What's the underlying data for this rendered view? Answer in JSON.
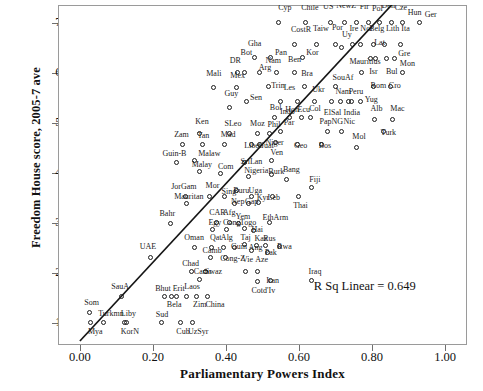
{
  "chart_data": {
    "type": "scatter",
    "title": "",
    "xlabel": "Parliamentary Powers Index",
    "ylabel": "Freedom House score, 2005-7 ave",
    "xlim": [
      -0.06,
      1.06
    ],
    "ylim": [
      0.55,
      7.35
    ],
    "xticks": [
      "0.00",
      "0.20",
      "0.40",
      "0.60",
      "0.80",
      "1.00"
    ],
    "xtickvals": [
      0.0,
      0.2,
      0.4,
      0.6,
      0.8,
      1.0
    ],
    "yticks": [
      "1.00",
      "2.00",
      "3.00",
      "4.00",
      "5.00",
      "6.00",
      "7.00"
    ],
    "ytickvals": [
      1,
      2,
      3,
      4,
      5,
      6,
      7
    ],
    "grid": false,
    "legend": "none",
    "annotation": "R Sq Linear = 0.649",
    "annotation_x": 0.78,
    "annotation_y": 1.72,
    "fit_line": {
      "x0": 0.0,
      "y0": 0.63,
      "x1": 0.855,
      "y1": 7.36
    },
    "points": [
      {
        "label": "Cyp",
        "x": 0.545,
        "y": 7.0,
        "lx": 0.543,
        "ly": 7.3
      },
      {
        "label": "Chile",
        "x": 0.62,
        "y": 7.0,
        "lx": 0.606,
        "ly": 7.3
      },
      {
        "label": "US",
        "x": 0.688,
        "y": 7.0,
        "lx": 0.666,
        "ly": 7.32
      },
      {
        "label": "NewZ",
        "x": 0.726,
        "y": 7.0,
        "lx": 0.702,
        "ly": 7.34
      },
      {
        "label": "Fir",
        "x": 0.76,
        "y": 7.0,
        "lx": 0.766,
        "ly": 7.32
      },
      {
        "label": "Pol",
        "x": 0.792,
        "y": 7.0,
        "lx": 0.8,
        "ly": 7.28
      },
      {
        "label": "Den",
        "x": 0.822,
        "y": 7.0,
        "lx": 0.826,
        "ly": 7.33
      },
      {
        "label": "Cze",
        "x": 0.854,
        "y": 7.0,
        "lx": 0.862,
        "ly": 7.3
      },
      {
        "label": "Hun",
        "x": 0.884,
        "y": 7.0,
        "lx": 0.898,
        "ly": 7.2
      },
      {
        "label": "Ger",
        "x": 0.93,
        "y": 7.0,
        "lx": 0.944,
        "ly": 7.16
      },
      {
        "label": "CostR",
        "x": 0.588,
        "y": 6.55,
        "lx": 0.578,
        "ly": 6.85
      },
      {
        "label": "Taiw",
        "x": 0.65,
        "y": 6.55,
        "lx": 0.638,
        "ly": 6.88
      },
      {
        "label": "Por",
        "x": 0.7,
        "y": 6.55,
        "lx": 0.69,
        "ly": 6.9
      },
      {
        "label": "Uy",
        "x": 0.718,
        "y": 6.5,
        "lx": 0.718,
        "ly": 6.76
      },
      {
        "label": "Ire",
        "x": 0.748,
        "y": 6.55,
        "lx": 0.738,
        "ly": 6.88
      },
      {
        "label": "Nor",
        "x": 0.77,
        "y": 6.55,
        "lx": 0.768,
        "ly": 6.88
      },
      {
        "label": "Belg",
        "x": 0.806,
        "y": 6.55,
        "lx": 0.792,
        "ly": 6.88
      },
      {
        "label": "Lith",
        "x": 0.836,
        "y": 6.55,
        "lx": 0.838,
        "ly": 6.88
      },
      {
        "label": "Ita",
        "x": 0.878,
        "y": 6.55,
        "lx": 0.88,
        "ly": 6.88
      },
      {
        "label": "Gha",
        "x": 0.48,
        "y": 6.3,
        "lx": 0.46,
        "ly": 6.58
      },
      {
        "label": "Pan",
        "x": 0.524,
        "y": 6.3,
        "lx": 0.534,
        "ly": 6.4
      },
      {
        "label": "Kor5",
        "x": 0.61,
        "y": 6.3,
        "lx": 0.62,
        "ly": 6.4
      },
      {
        "label": "Lat",
        "x": 0.812,
        "y": 6.28,
        "lx": 0.806,
        "ly": 6.6
      },
      {
        "label": "Gre",
        "x": 0.862,
        "y": 6.28,
        "lx": 0.872,
        "ly": 6.38
      },
      {
        "label": "Bul",
        "x": 0.842,
        "y": 6.28,
        "lx": 0.838,
        "ly": 6.02
      },
      {
        "label": "Isr",
        "x": 0.796,
        "y": 6.28,
        "lx": 0.792,
        "ly": 6.02
      },
      {
        "label": "DR",
        "x": 0.432,
        "y": 6.0,
        "lx": 0.41,
        "ly": 6.24
      },
      {
        "label": "Bot",
        "x": 0.452,
        "y": 6.0,
        "lx": 0.44,
        "ly": 6.4
      },
      {
        "label": "Arg",
        "x": 0.492,
        "y": 6.0,
        "lx": 0.49,
        "ly": 6.1
      },
      {
        "label": "Nam",
        "x": 0.54,
        "y": 6.0,
        "lx": 0.508,
        "ly": 6.24
      },
      {
        "label": "Ben",
        "x": 0.588,
        "y": 6.0,
        "lx": 0.57,
        "ly": 6.26
      },
      {
        "label": "Mauritius",
        "x": 0.772,
        "y": 6.0,
        "lx": 0.738,
        "ly": 6.22
      },
      {
        "label": "Mon",
        "x": 0.884,
        "y": 6.0,
        "lx": 0.876,
        "ly": 6.18
      },
      {
        "label": "Mali",
        "x": 0.366,
        "y": 5.7,
        "lx": 0.346,
        "ly": 5.98
      },
      {
        "label": "Mex",
        "x": 0.43,
        "y": 5.7,
        "lx": 0.412,
        "ly": 5.94
      },
      {
        "label": "Bra",
        "x": 0.616,
        "y": 5.72,
        "lx": 0.606,
        "ly": 5.98
      },
      {
        "label": "Trin",
        "x": 0.518,
        "y": 5.72,
        "lx": 0.524,
        "ly": 5.74
      },
      {
        "label": "SouAf",
        "x": 0.7,
        "y": 5.72,
        "lx": 0.692,
        "ly": 5.9
      },
      {
        "label": "Rom",
        "x": 0.806,
        "y": 5.72,
        "lx": 0.796,
        "ly": 5.74
      },
      {
        "label": "Cro",
        "x": 0.852,
        "y": 5.72,
        "lx": 0.846,
        "ly": 5.74
      },
      {
        "label": "Guy",
        "x": 0.412,
        "y": 5.3,
        "lx": 0.396,
        "ly": 5.58
      },
      {
        "label": "Sen",
        "x": 0.458,
        "y": 5.42,
        "lx": 0.466,
        "ly": 5.5
      },
      {
        "label": "Les",
        "x": 0.552,
        "y": 5.42,
        "lx": 0.558,
        "ly": 5.7
      },
      {
        "label": "Indo",
        "x": 0.596,
        "y": 5.42,
        "lx": 0.548,
        "ly": 5.22
      },
      {
        "label": "Ukr",
        "x": 0.644,
        "y": 5.42,
        "lx": 0.636,
        "ly": 5.66
      },
      {
        "label": "ElSal",
        "x": 0.69,
        "y": 5.42,
        "lx": 0.668,
        "ly": 5.2
      },
      {
        "label": "Nam2",
        "x": 0.714,
        "y": 5.42,
        "lx": 0.7,
        "ly": 5.62
      },
      {
        "label": "Peru",
        "x": 0.738,
        "y": 5.42,
        "lx": 0.736,
        "ly": 5.62
      },
      {
        "label": "Yug",
        "x": 0.77,
        "y": 5.42,
        "lx": 0.78,
        "ly": 5.46
      },
      {
        "label": "India",
        "x": 0.744,
        "y": 5.42,
        "lx": 0.722,
        "ly": 5.2
      },
      {
        "label": "Bol",
        "x": 0.534,
        "y": 5.1,
        "lx": 0.52,
        "ly": 5.3
      },
      {
        "label": "Hon",
        "x": 0.576,
        "y": 5.1,
        "lx": 0.562,
        "ly": 5.26
      },
      {
        "label": "Ecu",
        "x": 0.608,
        "y": 5.1,
        "lx": 0.596,
        "ly": 5.26
      },
      {
        "label": "Col",
        "x": 0.634,
        "y": 5.1,
        "lx": 0.628,
        "ly": 5.28
      },
      {
        "label": "Alb",
        "x": 0.808,
        "y": 5.05,
        "lx": 0.796,
        "ly": 5.28
      },
      {
        "label": "Mac",
        "x": 0.856,
        "y": 5.05,
        "lx": 0.85,
        "ly": 5.28
      },
      {
        "label": "Ken",
        "x": 0.33,
        "y": 4.78,
        "lx": 0.316,
        "ly": 5.02
      },
      {
        "label": "SLeo",
        "x": 0.41,
        "y": 4.78,
        "lx": 0.396,
        "ly": 4.98
      },
      {
        "label": "Moz",
        "x": 0.488,
        "y": 4.78,
        "lx": 0.466,
        "ly": 4.98
      },
      {
        "label": "Phil",
        "x": 0.52,
        "y": 4.78,
        "lx": 0.514,
        "ly": 4.96
      },
      {
        "label": "Par",
        "x": 0.552,
        "y": 4.82,
        "lx": 0.558,
        "ly": 5.0
      },
      {
        "label": "PapNG",
        "x": 0.678,
        "y": 4.82,
        "lx": 0.656,
        "ly": 5.02
      },
      {
        "label": "Nic",
        "x": 0.718,
        "y": 4.82,
        "lx": 0.722,
        "ly": 5.02
      },
      {
        "label": "Turk",
        "x": 0.834,
        "y": 4.82,
        "lx": 0.824,
        "ly": 4.8
      },
      {
        "label": "Zam",
        "x": 0.282,
        "y": 4.56,
        "lx": 0.258,
        "ly": 4.76
      },
      {
        "label": "Tan",
        "x": 0.336,
        "y": 4.56,
        "lx": 0.322,
        "ly": 4.74
      },
      {
        "label": "Mad",
        "x": 0.398,
        "y": 4.56,
        "lx": 0.386,
        "ly": 4.76
      },
      {
        "label": "Liber",
        "x": 0.47,
        "y": 4.56,
        "lx": 0.45,
        "ly": 4.54
      },
      {
        "label": "Guat",
        "x": 0.494,
        "y": 4.56,
        "lx": 0.488,
        "ly": 4.54
      },
      {
        "label": "Niger",
        "x": 0.538,
        "y": 4.6,
        "lx": 0.508,
        "ly": 4.6
      },
      {
        "label": "Geo",
        "x": 0.596,
        "y": 4.56,
        "lx": 0.586,
        "ly": 4.54
      },
      {
        "label": "Bos",
        "x": 0.662,
        "y": 4.56,
        "lx": 0.654,
        "ly": 4.54
      },
      {
        "label": "Mol",
        "x": 0.758,
        "y": 4.5,
        "lx": 0.746,
        "ly": 4.72
      },
      {
        "label": "Guin-B",
        "x": 0.266,
        "y": 4.2,
        "lx": 0.226,
        "ly": 4.38
      },
      {
        "label": "Malaw",
        "x": 0.316,
        "y": 4.24,
        "lx": 0.324,
        "ly": 4.38
      },
      {
        "label": "Malay",
        "x": 0.33,
        "y": 4.02,
        "lx": 0.306,
        "ly": 4.16
      },
      {
        "label": "SriLan",
        "x": 0.452,
        "y": 4.2,
        "lx": 0.44,
        "ly": 4.22
      },
      {
        "label": "Ven",
        "x": 0.526,
        "y": 4.24,
        "lx": 0.522,
        "ly": 4.4
      },
      {
        "label": "Com",
        "x": 0.386,
        "y": 3.98,
        "lx": 0.378,
        "ly": 4.12
      },
      {
        "label": "Nigeria",
        "x": 0.462,
        "y": 3.92,
        "lx": 0.45,
        "ly": 4.04
      },
      {
        "label": "Burk",
        "x": 0.526,
        "y": 3.96,
        "lx": 0.516,
        "ly": 4.02
      },
      {
        "label": "Bang",
        "x": 0.566,
        "y": 3.86,
        "lx": 0.556,
        "ly": 4.06
      },
      {
        "label": "Fiji",
        "x": 0.636,
        "y": 3.7,
        "lx": 0.628,
        "ly": 3.86
      },
      {
        "label": "JorGam",
        "x": 0.29,
        "y": 3.52,
        "lx": 0.25,
        "ly": 3.72
      },
      {
        "label": "Mor",
        "x": 0.356,
        "y": 3.52,
        "lx": 0.344,
        "ly": 3.74
      },
      {
        "label": "Sing",
        "x": 0.396,
        "y": 3.52,
        "lx": 0.388,
        "ly": 3.62
      },
      {
        "label": "Buru",
        "x": 0.43,
        "y": 3.64,
        "lx": 0.42,
        "ly": 3.64
      },
      {
        "label": "Uga",
        "x": 0.47,
        "y": 3.52,
        "lx": 0.462,
        "ly": 3.64
      },
      {
        "label": "Leb",
        "x": 0.528,
        "y": 3.52,
        "lx": 0.514,
        "ly": 3.5
      },
      {
        "label": "Thai",
        "x": 0.6,
        "y": 3.52,
        "lx": 0.584,
        "ly": 3.34
      },
      {
        "label": "Mauritan",
        "x": 0.292,
        "y": 3.38,
        "lx": 0.258,
        "ly": 3.52
      },
      {
        "label": "Nep",
        "x": 0.424,
        "y": 3.38,
        "lx": 0.414,
        "ly": 3.42
      },
      {
        "label": "Gap",
        "x": 0.462,
        "y": 3.38,
        "lx": 0.452,
        "ly": 3.42
      },
      {
        "label": "Kyr",
        "x": 0.49,
        "y": 3.4,
        "lx": 0.484,
        "ly": 3.5
      },
      {
        "label": "Bahr",
        "x": 0.25,
        "y": 2.98,
        "lx": 0.218,
        "ly": 3.18
      },
      {
        "label": "CAR",
        "x": 0.376,
        "y": 3.0,
        "lx": 0.354,
        "ly": 3.2
      },
      {
        "label": "Afg",
        "x": 0.412,
        "y": 3.0,
        "lx": 0.392,
        "ly": 3.2
      },
      {
        "label": "Yem",
        "x": 0.436,
        "y": 2.98,
        "lx": 0.426,
        "ly": 3.12
      },
      {
        "label": "EthArm",
        "x": 0.52,
        "y": 3.0,
        "lx": 0.5,
        "ly": 3.1
      },
      {
        "label": "Egy",
        "x": 0.364,
        "y": 2.86,
        "lx": 0.352,
        "ly": 3.0
      },
      {
        "label": "Cong",
        "x": 0.404,
        "y": 2.86,
        "lx": 0.392,
        "ly": 3.0
      },
      {
        "label": "Togo",
        "x": 0.452,
        "y": 2.88,
        "lx": 0.438,
        "ly": 3.0
      },
      {
        "label": "Hai",
        "x": 0.478,
        "y": 2.84,
        "lx": 0.47,
        "ly": 2.86
      },
      {
        "label": "Oman",
        "x": 0.316,
        "y": 2.5,
        "lx": 0.286,
        "ly": 2.7
      },
      {
        "label": "Qat",
        "x": 0.362,
        "y": 2.5,
        "lx": 0.356,
        "ly": 2.7
      },
      {
        "label": "Alg",
        "x": 0.394,
        "y": 2.5,
        "lx": 0.386,
        "ly": 2.7
      },
      {
        "label": "Guin",
        "x": 0.424,
        "y": 2.5,
        "lx": 0.414,
        "ly": 2.52
      },
      {
        "label": "Taj",
        "x": 0.452,
        "y": 2.56,
        "lx": 0.44,
        "ly": 2.7
      },
      {
        "label": "Kaz",
        "x": 0.486,
        "y": 2.54,
        "lx": 0.478,
        "ly": 2.68
      },
      {
        "label": "Rus",
        "x": 0.51,
        "y": 2.54,
        "lx": 0.502,
        "ly": 2.68
      },
      {
        "label": "Ang",
        "x": 0.47,
        "y": 2.44,
        "lx": 0.462,
        "ly": 2.5
      },
      {
        "label": "Pak",
        "x": 0.516,
        "y": 2.4,
        "lx": 0.506,
        "ly": 2.4
      },
      {
        "label": "Rwa",
        "x": 0.548,
        "y": 2.52,
        "lx": 0.54,
        "ly": 2.52
      },
      {
        "label": "UAE",
        "x": 0.196,
        "y": 2.3,
        "lx": 0.164,
        "ly": 2.52
      },
      {
        "label": "Camb",
        "x": 0.358,
        "y": 2.3,
        "lx": 0.336,
        "ly": 2.44
      },
      {
        "label": "Cong-Z",
        "x": 0.4,
        "y": 2.3,
        "lx": 0.384,
        "ly": 2.28
      },
      {
        "label": "Vie",
        "x": 0.454,
        "y": 2.02,
        "lx": 0.444,
        "ly": 2.26
      },
      {
        "label": "Aze",
        "x": 0.488,
        "y": 2.02,
        "lx": 0.48,
        "ly": 2.26
      },
      {
        "label": "Chad",
        "x": 0.308,
        "y": 2.02,
        "lx": 0.28,
        "ly": 2.18
      },
      {
        "label": "Swaz",
        "x": 0.346,
        "y": 2.02,
        "lx": 0.342,
        "ly": 2.02
      },
      {
        "label": "Camr",
        "x": 0.328,
        "y": 1.86,
        "lx": 0.312,
        "ly": 2.02
      },
      {
        "label": "Iran",
        "x": 0.522,
        "y": 1.84,
        "lx": 0.51,
        "ly": 1.84
      },
      {
        "label": "Iraq",
        "x": 0.636,
        "y": 1.84,
        "lx": 0.626,
        "ly": 2.02
      },
      {
        "label": "SauA",
        "x": 0.114,
        "y": 1.52,
        "lx": 0.086,
        "ly": 1.72
      },
      {
        "label": "Bhut",
        "x": 0.234,
        "y": 1.52,
        "lx": 0.206,
        "ly": 1.68
      },
      {
        "label": "Erit",
        "x": 0.266,
        "y": 1.52,
        "lx": 0.254,
        "ly": 1.68
      },
      {
        "label": "Laos",
        "x": 0.294,
        "y": 1.52,
        "lx": 0.286,
        "ly": 1.72
      },
      {
        "label": "Zim",
        "x": 0.322,
        "y": 1.52,
        "lx": 0.31,
        "ly": 1.36
      },
      {
        "label": "China",
        "x": 0.352,
        "y": 1.52,
        "lx": 0.344,
        "ly": 1.36
      },
      {
        "label": "Bela",
        "x": 0.252,
        "y": 1.52,
        "lx": 0.238,
        "ly": 1.36
      },
      {
        "label": "Cotd'Iv",
        "x": 0.488,
        "y": 1.82,
        "lx": 0.47,
        "ly": 1.64
      },
      {
        "label": "Som",
        "x": 0.028,
        "y": 1.2,
        "lx": 0.012,
        "ly": 1.4
      },
      {
        "label": "Mya",
        "x": 0.03,
        "y": 1.0,
        "lx": 0.022,
        "ly": 0.82
      },
      {
        "label": "Turkmn",
        "x": 0.066,
        "y": 1.0,
        "lx": 0.05,
        "ly": 1.18
      },
      {
        "label": "Liby",
        "x": 0.124,
        "y": 1.0,
        "lx": 0.112,
        "ly": 1.18
      },
      {
        "label": "KorN",
        "x": 0.128,
        "y": 1.0,
        "lx": 0.112,
        "ly": 0.82
      },
      {
        "label": "Sud",
        "x": 0.224,
        "y": 1.0,
        "lx": 0.208,
        "ly": 1.16
      },
      {
        "label": "Cub",
        "x": 0.278,
        "y": 1.0,
        "lx": 0.264,
        "ly": 0.82
      },
      {
        "label": "UzSyr",
        "x": 0.31,
        "y": 1.0,
        "lx": 0.296,
        "ly": 0.82
      }
    ]
  }
}
